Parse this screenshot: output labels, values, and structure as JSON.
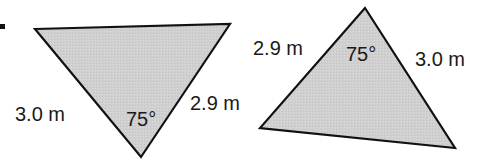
{
  "figure": {
    "marker": "•",
    "fill_color": "#cfcfcf",
    "stroke_color": "#111111",
    "triangles": [
      {
        "id": "triangle-1",
        "points": "35,29 230,24 141,157",
        "side_left": "3.0 m",
        "side_right": "2.9 m",
        "angle": "75°"
      },
      {
        "id": "triangle-2",
        "points": "365,8 260,128 455,148",
        "side_left": "2.9 m",
        "side_right": "3.0 m",
        "angle": "75°"
      }
    ]
  }
}
